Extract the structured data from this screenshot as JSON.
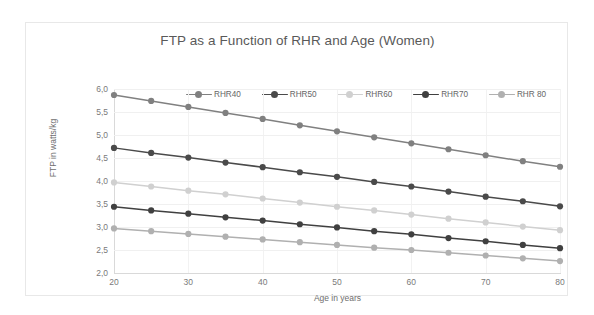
{
  "chart_data": {
    "type": "line",
    "title": "FTP as a Function of RHR and Age (Women)",
    "xlabel": "Age in years",
    "ylabel": "FTP in watts/kg",
    "x": [
      20,
      25,
      30,
      35,
      40,
      45,
      50,
      55,
      60,
      65,
      70,
      75,
      80
    ],
    "xlim": [
      20,
      80
    ],
    "ylim": [
      2.0,
      6.0
    ],
    "xticks": [
      "20",
      "30",
      "40",
      "50",
      "60",
      "70",
      "80"
    ],
    "xtick_values": [
      20,
      30,
      40,
      50,
      60,
      70,
      80
    ],
    "yticks": [
      "2,0",
      "2,5",
      "3,0",
      "3,5",
      "4,0",
      "4,5",
      "5,0",
      "5,5",
      "6,0"
    ],
    "ytick_values": [
      2.0,
      2.5,
      3.0,
      3.5,
      4.0,
      4.5,
      5.0,
      5.5,
      6.0
    ],
    "grid": true,
    "legend_position": "top",
    "decimal_separator": ",",
    "series": [
      {
        "name": "RHR40",
        "color": "#808080",
        "values": [
          5.87,
          5.74,
          5.61,
          5.48,
          5.35,
          5.21,
          5.08,
          4.95,
          4.82,
          4.69,
          4.56,
          4.43,
          4.31
        ]
      },
      {
        "name": "RHR50",
        "color": "#4a4a4a",
        "values": [
          4.72,
          4.61,
          4.51,
          4.4,
          4.3,
          4.19,
          4.09,
          3.98,
          3.88,
          3.77,
          3.66,
          3.56,
          3.45
        ]
      },
      {
        "name": "RHR60",
        "color": "#d0d0d0",
        "values": [
          3.97,
          3.88,
          3.79,
          3.71,
          3.62,
          3.53,
          3.44,
          3.36,
          3.27,
          3.18,
          3.1,
          3.01,
          2.93
        ]
      },
      {
        "name": "RHR70",
        "color": "#404040",
        "values": [
          3.44,
          3.36,
          3.29,
          3.21,
          3.14,
          3.06,
          2.99,
          2.91,
          2.84,
          2.76,
          2.69,
          2.61,
          2.54
        ]
      },
      {
        "name": "RHR 80",
        "color": "#b0b0b0",
        "values": [
          2.97,
          2.91,
          2.85,
          2.79,
          2.73,
          2.67,
          2.61,
          2.55,
          2.5,
          2.44,
          2.38,
          2.32,
          2.26
        ]
      }
    ]
  }
}
